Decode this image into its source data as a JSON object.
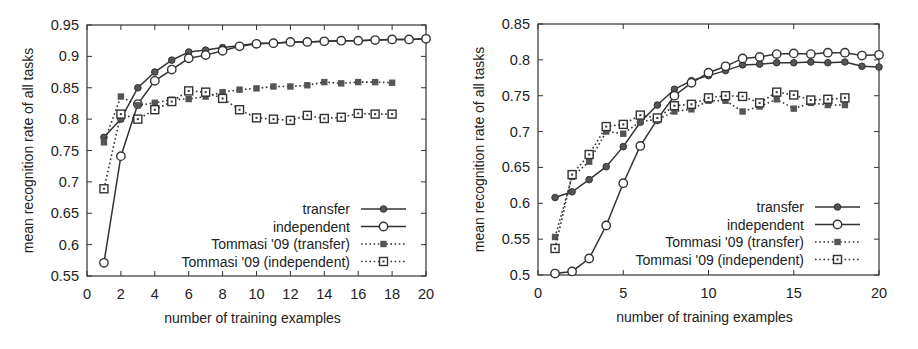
{
  "chart_data": [
    {
      "type": "line",
      "title": "",
      "xlabel": "number of training examples",
      "ylabel": "mean recognition rate of all tasks",
      "xlim": [
        0,
        20
      ],
      "ylim": [
        0.55,
        0.95
      ],
      "xticks": [
        0,
        2,
        4,
        6,
        8,
        10,
        12,
        14,
        16,
        18,
        20
      ],
      "yticks": [
        0.55,
        0.6,
        0.65,
        0.7,
        0.75,
        0.8,
        0.85,
        0.9,
        0.95
      ],
      "ytick_labels": [
        "0.55",
        "0.6",
        "0.65",
        "0.7",
        "0.75",
        "0.8",
        "0.85",
        "0.9",
        "0.95"
      ],
      "grid": false,
      "legend_position": "lower right",
      "series": [
        {
          "name": "transfer",
          "style": "solid",
          "marker": "filled-circle",
          "x": [
            1,
            2,
            3,
            4,
            5,
            6,
            7,
            8,
            9,
            10,
            11,
            12,
            13,
            14,
            15,
            16,
            17,
            18,
            19,
            20
          ],
          "values": [
            0.771,
            0.8,
            0.85,
            0.875,
            0.894,
            0.907,
            0.91,
            0.914,
            0.917,
            0.921,
            0.921,
            0.923,
            0.923,
            0.924,
            0.925,
            0.925,
            0.926,
            0.927,
            0.927,
            0.928
          ]
        },
        {
          "name": "independent",
          "style": "solid",
          "marker": "open-circle",
          "x": [
            1,
            2,
            3,
            4,
            5,
            6,
            7,
            8,
            9,
            10,
            11,
            12,
            13,
            14,
            15,
            16,
            17,
            18,
            19,
            20
          ],
          "values": [
            0.571,
            0.741,
            0.824,
            0.861,
            0.879,
            0.897,
            0.902,
            0.909,
            0.916,
            0.92,
            0.921,
            0.923,
            0.923,
            0.924,
            0.925,
            0.925,
            0.926,
            0.927,
            0.927,
            0.928
          ]
        },
        {
          "name": "Tommasi '09 (transfer)",
          "style": "dotted",
          "marker": "filled-square",
          "x": [
            1,
            2,
            3,
            4,
            5,
            6,
            7,
            8,
            9,
            10,
            11,
            12,
            13,
            14,
            15,
            16,
            17,
            18
          ],
          "values": [
            0.763,
            0.836,
            0.822,
            0.826,
            0.831,
            0.832,
            0.836,
            0.843,
            0.847,
            0.849,
            0.852,
            0.852,
            0.854,
            0.859,
            0.857,
            0.859,
            0.859,
            0.858
          ]
        },
        {
          "name": "Tommasi '09 (independent)",
          "style": "dotted",
          "marker": "open-square",
          "x": [
            1,
            2,
            3,
            4,
            5,
            6,
            7,
            8,
            9,
            10,
            11,
            12,
            13,
            14,
            15,
            16,
            17,
            18
          ],
          "values": [
            0.689,
            0.808,
            0.8,
            0.815,
            0.828,
            0.845,
            0.843,
            0.833,
            0.815,
            0.802,
            0.8,
            0.798,
            0.806,
            0.801,
            0.803,
            0.809,
            0.808,
            0.808
          ]
        }
      ]
    },
    {
      "type": "line",
      "title": "",
      "xlabel": "number of training examples",
      "ylabel": "mean recognition rate of all tasks",
      "xlim": [
        0,
        20
      ],
      "ylim": [
        0.5,
        0.85
      ],
      "xticks": [
        0,
        5,
        10,
        15,
        20
      ],
      "yticks": [
        0.5,
        0.55,
        0.6,
        0.65,
        0.7,
        0.75,
        0.8,
        0.85
      ],
      "ytick_labels": [
        "0.5",
        "0.55",
        "0.6",
        "0.65",
        "0.7",
        "0.75",
        "0.8",
        "0.85"
      ],
      "grid": false,
      "legend_position": "lower right",
      "series": [
        {
          "name": "transfer",
          "style": "solid",
          "marker": "filled-circle",
          "x": [
            1,
            2,
            3,
            4,
            5,
            6,
            7,
            8,
            9,
            10,
            11,
            12,
            13,
            14,
            15,
            16,
            17,
            18,
            19,
            20
          ],
          "values": [
            0.608,
            0.616,
            0.633,
            0.651,
            0.679,
            0.713,
            0.737,
            0.759,
            0.771,
            0.778,
            0.785,
            0.793,
            0.794,
            0.796,
            0.796,
            0.797,
            0.796,
            0.797,
            0.791,
            0.79
          ]
        },
        {
          "name": "independent",
          "style": "solid",
          "marker": "open-circle",
          "x": [
            1,
            2,
            3,
            4,
            5,
            6,
            7,
            8,
            9,
            10,
            11,
            12,
            13,
            14,
            15,
            16,
            17,
            18,
            19,
            20
          ],
          "values": [
            0.502,
            0.505,
            0.523,
            0.569,
            0.628,
            0.68,
            0.717,
            0.75,
            0.768,
            0.782,
            0.791,
            0.802,
            0.804,
            0.808,
            0.809,
            0.808,
            0.81,
            0.81,
            0.806,
            0.807
          ]
        },
        {
          "name": "Tommasi '09 (transfer)",
          "style": "dotted",
          "marker": "filled-square",
          "x": [
            1,
            2,
            3,
            4,
            5,
            6,
            7,
            8,
            9,
            10,
            11,
            12,
            13,
            14,
            15,
            16,
            17,
            18
          ],
          "values": [
            0.553,
            0.637,
            0.658,
            0.7,
            0.697,
            0.714,
            0.717,
            0.728,
            0.731,
            0.743,
            0.743,
            0.728,
            0.735,
            0.745,
            0.732,
            0.74,
            0.737,
            0.737
          ]
        },
        {
          "name": "Tommasi '09 (independent)",
          "style": "dotted",
          "marker": "open-square",
          "x": [
            1,
            2,
            3,
            4,
            5,
            6,
            7,
            8,
            9,
            10,
            11,
            12,
            13,
            14,
            15,
            16,
            17,
            18
          ],
          "values": [
            0.537,
            0.64,
            0.668,
            0.707,
            0.71,
            0.723,
            0.719,
            0.736,
            0.738,
            0.747,
            0.75,
            0.749,
            0.74,
            0.755,
            0.751,
            0.744,
            0.745,
            0.747
          ]
        }
      ]
    }
  ],
  "layout": [
    {
      "plot": {
        "left": 87,
        "top": 25,
        "right": 426,
        "bottom": 276
      },
      "legend": {
        "right_text_x": 350,
        "line_x1": 361,
        "line_x2": 406,
        "first_y": 209,
        "row_h": 17.5
      }
    },
    {
      "plot": {
        "left": 79,
        "top": 24,
        "right": 420,
        "bottom": 275
      },
      "legend": {
        "right_text_x": 345,
        "line_x1": 356,
        "line_x2": 401,
        "first_y": 207,
        "row_h": 17.5
      }
    }
  ],
  "colors": {
    "axis": "#333333",
    "line": "#333333",
    "marker_fill": "#555555",
    "text": "#222222"
  }
}
